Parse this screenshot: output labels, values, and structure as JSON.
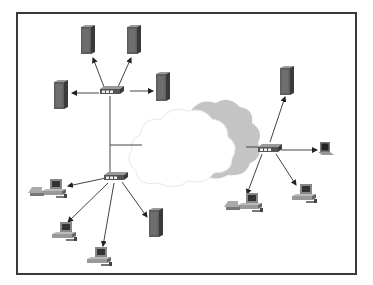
{
  "diagram": {
    "title": "Network topology: two LAN segments and a remote site connected through a cloud (WAN/Internet)",
    "colors": {
      "frame": "#3a3a3a",
      "server_body": "#4a4a4a",
      "server_face": "#6b6b6b",
      "hub_body": "#5a5a5a",
      "cloud_front": "#ffffff",
      "cloud_back": "#c4c4c4",
      "link": "#444444"
    },
    "nodes": [
      {
        "id": "hub-top",
        "type": "hub",
        "label": "Hub (upper LAN)"
      },
      {
        "id": "server-top-1",
        "type": "server",
        "label": "Server"
      },
      {
        "id": "server-top-2",
        "type": "server",
        "label": "Server"
      },
      {
        "id": "server-left",
        "type": "server",
        "label": "Server"
      },
      {
        "id": "server-right-upper",
        "type": "server",
        "label": "Server"
      },
      {
        "id": "hub-lower",
        "type": "hub",
        "label": "Hub (lower LAN)"
      },
      {
        "id": "workstation-1",
        "type": "workstation",
        "label": "Workstation"
      },
      {
        "id": "workstation-2",
        "type": "workstation",
        "label": "Workstation"
      },
      {
        "id": "workstation-3",
        "type": "workstation",
        "label": "Workstation"
      },
      {
        "id": "server-lower",
        "type": "server",
        "label": "Server"
      },
      {
        "id": "cloud",
        "type": "cloud",
        "label": "Network cloud"
      },
      {
        "id": "hub-remote",
        "type": "hub",
        "label": "Hub (remote site)"
      },
      {
        "id": "server-remote",
        "type": "server",
        "label": "Server"
      },
      {
        "id": "laptop-remote",
        "type": "laptop",
        "label": "Laptop"
      },
      {
        "id": "workstation-remote-1",
        "type": "workstation",
        "label": "Workstation"
      },
      {
        "id": "workstation-remote-2",
        "type": "workstation",
        "label": "Workstation"
      }
    ],
    "edges": [
      [
        "hub-top",
        "server-top-1"
      ],
      [
        "hub-top",
        "server-top-2"
      ],
      [
        "hub-top",
        "server-left"
      ],
      [
        "hub-top",
        "server-right-upper"
      ],
      [
        "hub-top",
        "hub-lower"
      ],
      [
        "hub-top",
        "cloud"
      ],
      [
        "hub-lower",
        "workstation-1"
      ],
      [
        "hub-lower",
        "workstation-2"
      ],
      [
        "hub-lower",
        "workstation-3"
      ],
      [
        "hub-lower",
        "server-lower"
      ],
      [
        "cloud",
        "hub-remote"
      ],
      [
        "hub-remote",
        "server-remote"
      ],
      [
        "hub-remote",
        "laptop-remote"
      ],
      [
        "hub-remote",
        "workstation-remote-1"
      ],
      [
        "hub-remote",
        "workstation-remote-2"
      ]
    ]
  }
}
